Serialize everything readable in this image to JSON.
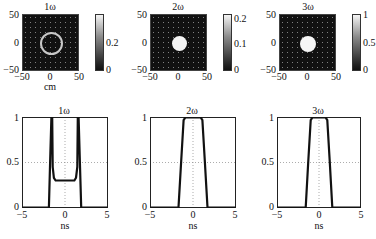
{
  "figure": {
    "top_row": [
      {
        "title": "1ω",
        "xlabel": "cm",
        "x_ticks": [
          "−50",
          "0",
          "50"
        ],
        "y_ticks": [
          "50",
          "0",
          "−50"
        ],
        "colorbar_ticks": [
          "0.2",
          "0"
        ],
        "spot": "ring"
      },
      {
        "title": "2ω",
        "xlabel": "",
        "x_ticks": [
          "−50",
          "0",
          "50"
        ],
        "y_ticks": [
          "50",
          "0",
          "−50"
        ],
        "colorbar_ticks": [
          "0.2",
          "0.1",
          "0"
        ],
        "spot": "disk"
      },
      {
        "title": "3ω",
        "xlabel": "",
        "x_ticks": [
          "−50",
          "0",
          "50"
        ],
        "y_ticks": [
          "50",
          "0",
          "−50"
        ],
        "colorbar_ticks": [
          "1",
          "0.5",
          "0"
        ],
        "spot": "disk"
      }
    ],
    "bottom_row": [
      {
        "title": "1ω",
        "xlabel": "ns",
        "x_ticks": [
          "−5",
          "0",
          "5"
        ],
        "y_ticks": [
          "1",
          "0.5",
          "0"
        ]
      },
      {
        "title": "2ω",
        "xlabel": "ns",
        "x_ticks": [
          "−5",
          "0",
          "5"
        ],
        "y_ticks": [
          "1",
          "0.5",
          "0"
        ]
      },
      {
        "title": "3ω",
        "xlabel": "ns",
        "x_ticks": [
          "−5",
          "0",
          "5"
        ],
        "y_ticks": [
          "1",
          "0.5",
          "0"
        ]
      }
    ]
  },
  "chart_data": [
    {
      "type": "heatmap",
      "title": "1ω",
      "xlabel": "cm",
      "ylabel": "",
      "xlim": [
        -50,
        50
      ],
      "ylim": [
        -50,
        50
      ],
      "colorbar": {
        "range": [
          0,
          0.3
        ],
        "ticks": [
          0,
          0.2
        ]
      },
      "description": "annular ring of radius ~12 cm centered at origin on dark background"
    },
    {
      "type": "heatmap",
      "title": "2ω",
      "xlabel": "",
      "ylabel": "",
      "xlim": [
        -50,
        50
      ],
      "ylim": [
        -50,
        50
      ],
      "colorbar": {
        "range": [
          0,
          0.2
        ],
        "ticks": [
          0,
          0.1,
          0.2
        ]
      },
      "description": "filled bright disk of radius ~10 cm centered at origin"
    },
    {
      "type": "heatmap",
      "title": "3ω",
      "xlabel": "",
      "ylabel": "",
      "xlim": [
        -50,
        50
      ],
      "ylim": [
        -50,
        50
      ],
      "colorbar": {
        "range": [
          0,
          1
        ],
        "ticks": [
          0,
          0.5,
          1
        ]
      },
      "description": "filled bright disk of radius ~10 cm centered at origin"
    },
    {
      "type": "line",
      "title": "1ω",
      "xlabel": "ns",
      "ylabel": "",
      "xlim": [
        -5,
        5
      ],
      "ylim": [
        0,
        1
      ],
      "grid": true,
      "series": [
        {
          "name": "1ω pulse",
          "x": [
            -5,
            -1.9,
            -1.75,
            -1.6,
            -1.5,
            -1.45,
            -1.3,
            -1.1,
            1.1,
            1.3,
            1.45,
            1.5,
            1.6,
            1.75,
            1.9,
            5
          ],
          "y": [
            0,
            0,
            0.5,
            1.0,
            1.0,
            0.45,
            0.33,
            0.3,
            0.3,
            0.33,
            0.45,
            1.0,
            1.0,
            0.5,
            0,
            0
          ]
        }
      ]
    },
    {
      "type": "line",
      "title": "2ω",
      "xlabel": "ns",
      "ylabel": "",
      "xlim": [
        -5,
        5
      ],
      "ylim": [
        0,
        1
      ],
      "grid": true,
      "series": [
        {
          "name": "2ω pulse",
          "x": [
            -5,
            -1.7,
            -1.4,
            -1.1,
            -0.9,
            0.9,
            1.1,
            1.4,
            1.7,
            5
          ],
          "y": [
            0,
            0,
            0.5,
            0.97,
            1.0,
            1.0,
            0.97,
            0.5,
            0,
            0
          ]
        }
      ]
    },
    {
      "type": "line",
      "title": "3ω",
      "xlabel": "ns",
      "ylabel": "",
      "xlim": [
        -5,
        5
      ],
      "ylim": [
        0,
        1
      ],
      "grid": true,
      "series": [
        {
          "name": "3ω pulse",
          "x": [
            -5,
            -1.6,
            -1.3,
            -1.0,
            -0.8,
            0.8,
            1.0,
            1.3,
            1.6,
            5
          ],
          "y": [
            0,
            0,
            0.5,
            0.97,
            1.0,
            1.0,
            0.97,
            0.5,
            0,
            0
          ]
        }
      ]
    }
  ]
}
